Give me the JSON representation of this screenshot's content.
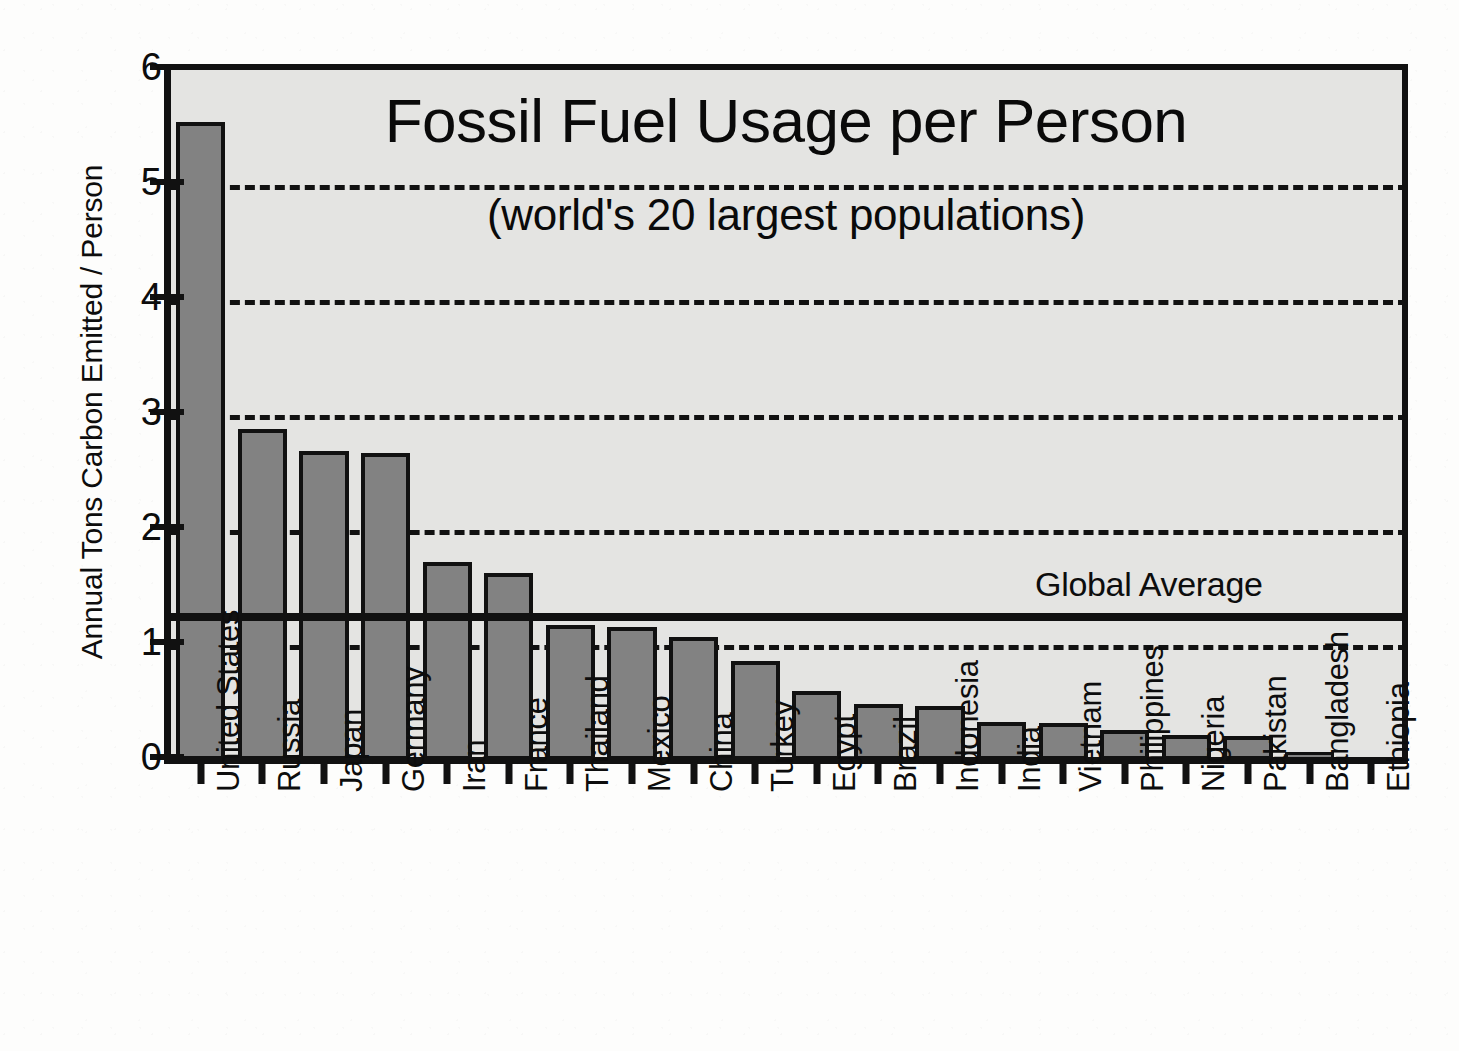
{
  "chart_data": {
    "type": "bar",
    "title": "Fossil Fuel Usage per Person",
    "subtitle": "(world's 20 largest populations)",
    "xlabel": "",
    "ylabel": "Annual Tons Carbon Emitted / Person",
    "ylim": [
      0,
      6
    ],
    "yticks": [
      0,
      1,
      2,
      3,
      4,
      5,
      6
    ],
    "ytick_labels": [
      "0",
      "1",
      "2",
      "3",
      "4",
      "5",
      "6"
    ],
    "gridlines": [
      1,
      2,
      3,
      4,
      5
    ],
    "grid": "horizontal-dashed",
    "legend": "none",
    "categories": [
      "United States",
      "Russia",
      "Japan",
      "Germany",
      "Iran",
      "France",
      "Thailand",
      "Mexico",
      "China",
      "Turkey",
      "Egypt",
      "Brazil",
      "Indonesia",
      "India",
      "Vietnam",
      "Philippines",
      "Nigeria",
      "Pakistan",
      "Bangladesh",
      "Ethiopia"
    ],
    "values": [
      5.55,
      2.88,
      2.69,
      2.67,
      1.72,
      1.63,
      1.17,
      1.16,
      1.07,
      0.86,
      0.6,
      0.49,
      0.47,
      0.33,
      0.32,
      0.26,
      0.22,
      0.21,
      0.07,
      0.02
    ],
    "annotations": [
      {
        "label": "Global Average",
        "value": 1.22,
        "kind": "hline"
      }
    ],
    "colors": {
      "bar_fill": "#828282",
      "bar_edge": "#111111",
      "plot_background": "#e4e4e2",
      "page_background": "#fdfdfc",
      "axis": "#111111",
      "gridline": "#111111",
      "annotation_line": "#111111",
      "text": "#0d0d0d"
    }
  }
}
